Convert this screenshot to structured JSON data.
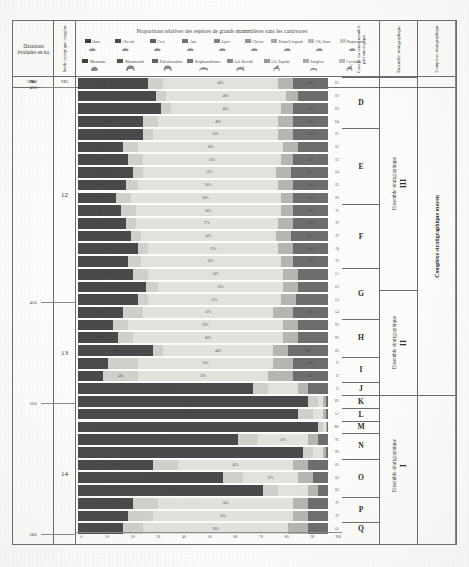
{
  "figure": {
    "type": "stacked-bar-stratigraphic-table",
    "chart_title": "Proportions relatives des espèces de grands mammifères sans les carnivores"
  },
  "headers": {
    "dates": "Datations évaluées en ka",
    "isotope_stage": "Stade isotopique oxygène",
    "chart": "Proportions relatives des espèces de grands mammifères sans les carnivores",
    "layer": "Couche ou sous-ensemble paléontologique",
    "ensemble": "Ensemble stratigraphique",
    "complexe": "Complexe stratigraphique",
    "sub_dates": "ka",
    "sub_stage": "SIO",
    "sub_layer": "C/S-E",
    "sub_ensemble": "ES",
    "sub_complexe": "CS"
  },
  "legend": {
    "row1": [
      {
        "name": "Ours",
        "color": "#3b3b3b"
      },
      {
        "name": "Cheval",
        "color": "#4c4c4c"
      },
      {
        "name": "Cerf",
        "color": "#5e5e5e"
      },
      {
        "name": "Ane",
        "color": "#707070"
      },
      {
        "name": "Lynx",
        "color": "#828282"
      },
      {
        "name": "Chèvre",
        "color": "#949494"
      },
      {
        "name": "Daim/Léopard",
        "color": "#a6a6a6"
      },
      {
        "name": "Ch. Ours",
        "color": "#b8b8b8"
      },
      {
        "name": "Rupicapra",
        "color": "#cacaca"
      }
    ],
    "row1_silhouettes": [
      {
        "name": "Marmotte",
        "color": "#3f3f3f"
      },
      {
        "name": "Mammouth",
        "color": "#515151"
      },
      {
        "name": "Paléoloxodon",
        "color": "#636363"
      },
      {
        "name": "Stéphanorhinus",
        "color": "#757575"
      },
      {
        "name": "Gd. Bovidé",
        "color": "#878787"
      },
      {
        "name": "Gd. Équidé",
        "color": "#999999"
      },
      {
        "name": "Sanglier",
        "color": "#ababab"
      },
      {
        "name": "Cervidés",
        "color": "#bdbdbd"
      }
    ]
  },
  "axis": {
    "ticks": [
      "0",
      "10",
      "20",
      "30",
      "40",
      "50",
      "60",
      "70",
      "80",
      "90",
      "100"
    ],
    "unit": "%",
    "min": 0,
    "max": 100
  },
  "date_markers": [
    {
      "label": "410",
      "y_pct": 0.0
    },
    {
      "label": "450",
      "y_pct": 47.0
    },
    {
      "label": "520",
      "y_pct": 69.0
    },
    {
      "label": "580",
      "y_pct": 97.5
    }
  ],
  "isotope_stages": [
    {
      "label": "12",
      "start_pct": 0.0,
      "end_pct": 47.0
    },
    {
      "label": "13",
      "start_pct": 47.0,
      "end_pct": 69.0
    },
    {
      "label": "14",
      "start_pct": 69.0,
      "end_pct": 100.0
    }
  ],
  "complexes": [
    {
      "label": "Complexe stratigraphique moyen",
      "start_pct": 0.0,
      "end_pct": 69.5
    }
  ],
  "ensembles": [
    {
      "label": "Ensemble stratigraphique",
      "roman": "III",
      "start_pct": 0.0,
      "end_pct": 46.5
    },
    {
      "label": "Ensemble stratigraphique",
      "roman": "II",
      "start_pct": 46.5,
      "end_pct": 69.5
    },
    {
      "label": "Ensemble stratigraphique",
      "roman": "I",
      "start_pct": 69.5,
      "end_pct": 100.0
    }
  ],
  "layers": [
    {
      "label": "D",
      "rows": 4
    },
    {
      "label": "E",
      "rows": 6
    },
    {
      "label": "F",
      "rows": 5
    },
    {
      "label": "G",
      "rows": 4
    },
    {
      "label": "H",
      "rows": 3
    },
    {
      "label": "I",
      "rows": 2
    },
    {
      "label": "J",
      "rows": 1
    },
    {
      "label": "K",
      "rows": 1
    },
    {
      "label": "L",
      "rows": 1
    },
    {
      "label": "M",
      "rows": 1
    },
    {
      "label": "N",
      "rows": 2
    },
    {
      "label": "O",
      "rows": 3
    },
    {
      "label": "P",
      "rows": 2
    },
    {
      "label": "Q",
      "rows": 1
    }
  ],
  "chart_data": {
    "type": "bar",
    "orientation": "horizontal-stacked",
    "title": "Proportions relatives des espèces de grands mammifères sans les carnivores",
    "xlabel": "%",
    "ylabel": "Couche ou sous-ensemble paléontologique",
    "xlim": [
      0,
      100
    ],
    "grid": false,
    "legend_position": "top",
    "categories": [
      "D1",
      "D2",
      "D3",
      "D4",
      "E1",
      "E2",
      "E3",
      "E4",
      "E5",
      "E6",
      "F1",
      "F2",
      "F3",
      "F4",
      "F5",
      "G1",
      "G2",
      "G3",
      "G4",
      "H1",
      "H2",
      "H3",
      "I1",
      "I2",
      "J1",
      "K1",
      "L1",
      "M1",
      "N1",
      "N2",
      "O1",
      "O2",
      "O3",
      "P1",
      "P2",
      "Q1"
    ],
    "series": [
      {
        "name": "Gd. Bovidé",
        "color": "#4a4a4a",
        "values": [
          28,
          31,
          33,
          26,
          26,
          18,
          20,
          22,
          19,
          15,
          17,
          19,
          21,
          24,
          20,
          22,
          27,
          24,
          18,
          14,
          16,
          30,
          12,
          10,
          70,
          92,
          88,
          96,
          64,
          90,
          30,
          58,
          74,
          22,
          20,
          18
        ]
      },
      {
        "name": "Cervidés",
        "color": "#d0d0cd",
        "values": [
          6,
          4,
          4,
          6,
          4,
          6,
          6,
          4,
          5,
          6,
          6,
          4,
          4,
          4,
          5,
          6,
          5,
          4,
          8,
          6,
          6,
          4,
          12,
          14,
          6,
          4,
          6,
          2,
          8,
          4,
          10,
          8,
          6,
          10,
          10,
          8
        ]
      },
      {
        "name": "Gd. Équidé",
        "color": "#e2e2df",
        "values": [
          46,
          48,
          44,
          48,
          50,
          58,
          55,
          53,
          56,
          60,
          58,
          57,
          54,
          52,
          56,
          54,
          50,
          53,
          52,
          62,
          60,
          44,
          54,
          52,
          12,
          2,
          4,
          1,
          20,
          4,
          46,
          22,
          12,
          54,
          56,
          58
        ]
      },
      {
        "name": "Stéphanorhinus",
        "color": "#b6b6b3",
        "values": [
          6,
          5,
          5,
          6,
          6,
          6,
          5,
          6,
          6,
          5,
          5,
          6,
          6,
          6,
          5,
          6,
          6,
          6,
          8,
          6,
          6,
          6,
          8,
          10,
          4,
          1,
          1,
          0.5,
          4,
          1,
          6,
          6,
          4,
          6,
          6,
          8
        ]
      },
      {
        "name": "Sanglier",
        "color": "#6e6e6e",
        "values": [
          14,
          12,
          14,
          14,
          14,
          12,
          14,
          15,
          14,
          14,
          14,
          14,
          15,
          14,
          14,
          12,
          12,
          13,
          14,
          12,
          12,
          16,
          14,
          14,
          8,
          1,
          1,
          0.5,
          4,
          1,
          8,
          6,
          4,
          8,
          8,
          8
        ]
      }
    ]
  }
}
